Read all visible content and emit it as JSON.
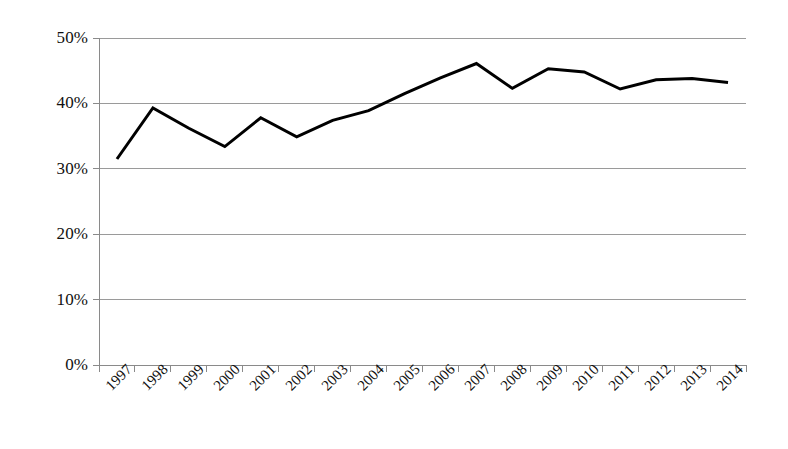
{
  "chart_data": {
    "type": "line",
    "title": "",
    "subtitle": "",
    "xlabel": "",
    "ylabel": "",
    "categories": [
      "1997",
      "1998",
      "1999",
      "2000",
      "2001",
      "2002",
      "2003",
      "2004",
      "2005",
      "2006",
      "2007",
      "2008",
      "2009",
      "2010",
      "2011",
      "2012",
      "2013",
      "2014"
    ],
    "series": [
      {
        "name": "",
        "values": [
          31.5,
          39.3,
          36.2,
          33.4,
          37.8,
          34.9,
          37.4,
          38.9,
          41.5,
          43.9,
          46.1,
          42.3,
          45.3,
          44.8,
          42.2,
          43.6,
          43.8,
          43.2
        ],
        "color": "#000000",
        "line_width": 3
      }
    ],
    "ylim": [
      0,
      50
    ],
    "y_ticks": [
      0,
      10,
      20,
      30,
      40,
      50
    ],
    "y_tick_labels": [
      "0%",
      "10%",
      "20%",
      "30%",
      "40%",
      "50%"
    ],
    "grid": true,
    "grid_axis": "y",
    "grid_color": "#9a9a9a",
    "legend": false,
    "legend_position": "none",
    "value_format": "percent",
    "axis_color": "#8a8a8a",
    "background": "#ffffff"
  },
  "plot_geometry": {
    "left": 99,
    "right": 746,
    "top": 38,
    "bottom": 365
  }
}
